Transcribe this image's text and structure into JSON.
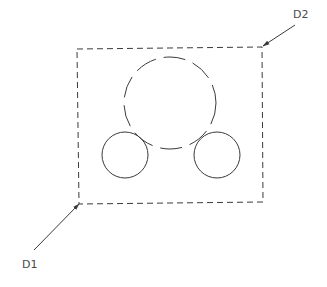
{
  "diagram": {
    "stroke_color": "#3a3a3a",
    "background": "#ffffff",
    "selection_window": {
      "corners": [
        [
          77,
          49
        ],
        [
          262,
          47
        ],
        [
          263,
          202
        ],
        [
          79,
          204
        ]
      ],
      "linetype": "dashed"
    },
    "large_circle": {
      "cx": 170,
      "cy": 103,
      "r": 46,
      "linetype": "dashed"
    },
    "small_circles": [
      {
        "cx": 125,
        "cy": 155,
        "r": 23,
        "linetype": "solid"
      },
      {
        "cx": 217,
        "cy": 155,
        "r": 23,
        "linetype": "solid"
      }
    ],
    "leaders": [
      {
        "label": "D1",
        "from": [
          34,
          250
        ],
        "to": [
          79,
          204
        ],
        "label_pos": [
          22,
          268
        ]
      },
      {
        "label": "D2",
        "from": [
          295,
          25
        ],
        "to": [
          263,
          46
        ],
        "label_pos": [
          293,
          18
        ]
      }
    ]
  }
}
